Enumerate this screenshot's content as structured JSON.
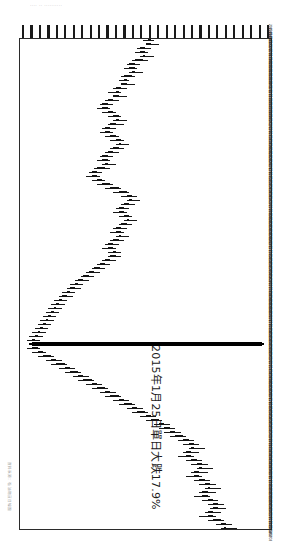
{
  "page": {
    "orientation": "rotated-90",
    "background_color": "#ffffff",
    "scan_header_text": "....  ..  ..........",
    "source_note": "資料來源：石油期貨日線圖"
  },
  "annotation": {
    "text": "2015年1月25日單日大跌17.9%",
    "color": "#1a1a1a"
  },
  "axes": {
    "price_axis_position": "top",
    "date_axis_position": "right",
    "tick_count": 30,
    "date_labels": [
      "2015/01/02",
      "2015/01/05",
      "2015/01/06",
      "2015/01/07",
      "2015/01/08",
      "2015/01/09",
      "2015/01/12",
      "2015/01/13",
      "2015/01/14",
      "2015/01/15",
      "2015/01/16",
      "2015/01/19",
      "2015/01/20",
      "2015/01/21",
      "2015/01/22",
      "2015/01/23",
      "2015/01/26",
      "2015/01/27",
      "2015/01/28",
      "2015/01/29",
      "2015/01/30",
      "2015/02/02",
      "2015/02/03",
      "2015/02/04",
      "2015/02/05",
      "2015/02/06",
      "2015/02/09",
      "2015/02/10",
      "2015/02/11",
      "2015/02/12",
      "2015/02/13",
      "2015/02/16",
      "2015/02/17",
      "2015/02/24",
      "2015/02/25",
      "2015/02/26",
      "2015/02/27",
      "2015/03/02",
      "2015/03/03",
      "2015/03/04",
      "2015/03/05",
      "2015/03/06",
      "2015/03/09",
      "2015/03/10",
      "2015/03/11",
      "2015/03/12",
      "2015/03/13",
      "2015/03/16",
      "2015/03/17",
      "2015/03/18",
      "2015/03/19",
      "2015/03/20",
      "2015/03/23",
      "2015/03/24",
      "2015/03/25",
      "2015/03/26",
      "2015/03/27",
      "2015/03/30",
      "2015/03/31",
      "2015/04/01",
      "2015/04/02",
      "2015/04/07",
      "2015/04/08",
      "2015/04/09",
      "2015/04/10",
      "2015/04/13",
      "2015/04/14",
      "2015/04/15",
      "2015/04/16",
      "2015/04/17",
      "2015/04/20",
      "2015/04/21",
      "2015/04/22",
      "2015/04/23",
      "2015/04/24",
      "2015/04/27",
      "2015/04/28",
      "2015/04/29",
      "2015/04/30",
      "2015/05/04",
      "2015/05/05",
      "2015/05/06",
      "2015/05/07",
      "2015/05/08",
      "2015/05/11",
      "2015/05/12",
      "2015/05/13",
      "2015/05/14",
      "2015/05/15",
      "2015/05/18",
      "2015/05/19",
      "2015/05/20",
      "2015/05/21",
      "2015/05/22",
      "2015/05/25",
      "2015/05/26",
      "2015/05/27",
      "2015/05/28",
      "2015/05/29",
      "2015/06/01",
      "2015/06/02",
      "2015/06/03",
      "2015/06/04",
      "2015/06/05",
      "2015/06/08",
      "2015/06/09",
      "2015/06/10",
      "2015/06/11",
      "2015/06/12",
      "2015/06/15",
      "2015/06/16",
      "2015/06/17",
      "2015/06/18",
      "2015/06/19",
      "2015/06/23",
      "2015/06/24",
      "2015/06/25",
      "2015/06/26",
      "2015/06/29",
      "2015/06/30",
      "2015/07/01",
      "2015/07/02",
      "2015/07/03"
    ]
  },
  "chart_data": {
    "type": "candlestick",
    "title": "",
    "xlabel": "",
    "ylabel": "",
    "orientation": "horizontal",
    "colors": {
      "up_body": "#ffffff",
      "down_body": "#111111",
      "outline": "#141414",
      "crash": "#000000"
    },
    "crash_event": {
      "index": 76,
      "label": "2015年1月25日單日大跌17.9%",
      "percent_change": -17.9
    },
    "candles": [
      {
        "i": 0,
        "o": 56,
        "h": 58,
        "l": 54,
        "c": 57,
        "dir": "up"
      },
      {
        "i": 1,
        "o": 57,
        "h": 60,
        "l": 56,
        "c": 55,
        "dir": "down"
      },
      {
        "i": 2,
        "o": 55,
        "h": 57,
        "l": 52,
        "c": 53,
        "dir": "down"
      },
      {
        "i": 3,
        "o": 53,
        "h": 56,
        "l": 51,
        "c": 55,
        "dir": "up"
      },
      {
        "i": 4,
        "o": 55,
        "h": 58,
        "l": 53,
        "c": 54,
        "dir": "down"
      },
      {
        "i": 5,
        "o": 54,
        "h": 56,
        "l": 50,
        "c": 51,
        "dir": "down"
      },
      {
        "i": 6,
        "o": 51,
        "h": 53,
        "l": 48,
        "c": 49,
        "dir": "down"
      },
      {
        "i": 7,
        "o": 49,
        "h": 52,
        "l": 47,
        "c": 51,
        "dir": "up"
      },
      {
        "i": 8,
        "o": 51,
        "h": 54,
        "l": 49,
        "c": 50,
        "dir": "down"
      },
      {
        "i": 9,
        "o": 50,
        "h": 51,
        "l": 46,
        "c": 47,
        "dir": "down"
      },
      {
        "i": 10,
        "o": 47,
        "h": 49,
        "l": 45,
        "c": 48,
        "dir": "up"
      },
      {
        "i": 11,
        "o": 48,
        "h": 51,
        "l": 46,
        "c": 46,
        "dir": "down"
      },
      {
        "i": 12,
        "o": 46,
        "h": 48,
        "l": 43,
        "c": 44,
        "dir": "down"
      },
      {
        "i": 13,
        "o": 44,
        "h": 46,
        "l": 41,
        "c": 45,
        "dir": "up"
      },
      {
        "i": 14,
        "o": 45,
        "h": 48,
        "l": 43,
        "c": 43,
        "dir": "down"
      },
      {
        "i": 15,
        "o": 43,
        "h": 45,
        "l": 40,
        "c": 41,
        "dir": "down"
      },
      {
        "i": 16,
        "o": 41,
        "h": 43,
        "l": 38,
        "c": 39,
        "dir": "down"
      },
      {
        "i": 17,
        "o": 39,
        "h": 42,
        "l": 37,
        "c": 41,
        "dir": "up"
      },
      {
        "i": 18,
        "o": 41,
        "h": 44,
        "l": 39,
        "c": 43,
        "dir": "up"
      },
      {
        "i": 19,
        "o": 43,
        "h": 46,
        "l": 41,
        "c": 45,
        "dir": "up"
      },
      {
        "i": 20,
        "o": 45,
        "h": 48,
        "l": 43,
        "c": 44,
        "dir": "down"
      },
      {
        "i": 21,
        "o": 44,
        "h": 47,
        "l": 41,
        "c": 42,
        "dir": "down"
      },
      {
        "i": 22,
        "o": 42,
        "h": 44,
        "l": 39,
        "c": 40,
        "dir": "down"
      },
      {
        "i": 23,
        "o": 40,
        "h": 43,
        "l": 38,
        "c": 42,
        "dir": "up"
      },
      {
        "i": 24,
        "o": 42,
        "h": 45,
        "l": 40,
        "c": 44,
        "dir": "up"
      },
      {
        "i": 25,
        "o": 44,
        "h": 47,
        "l": 42,
        "c": 46,
        "dir": "up"
      },
      {
        "i": 26,
        "o": 46,
        "h": 49,
        "l": 44,
        "c": 45,
        "dir": "down"
      },
      {
        "i": 27,
        "o": 45,
        "h": 47,
        "l": 42,
        "c": 43,
        "dir": "down"
      },
      {
        "i": 28,
        "o": 43,
        "h": 45,
        "l": 40,
        "c": 41,
        "dir": "down"
      },
      {
        "i": 29,
        "o": 41,
        "h": 43,
        "l": 38,
        "c": 39,
        "dir": "down"
      },
      {
        "i": 30,
        "o": 39,
        "h": 42,
        "l": 37,
        "c": 41,
        "dir": "up"
      },
      {
        "i": 31,
        "o": 41,
        "h": 44,
        "l": 39,
        "c": 40,
        "dir": "down"
      },
      {
        "i": 32,
        "o": 40,
        "h": 42,
        "l": 36,
        "c": 37,
        "dir": "down"
      },
      {
        "i": 33,
        "o": 37,
        "h": 39,
        "l": 34,
        "c": 35,
        "dir": "down"
      },
      {
        "i": 34,
        "o": 35,
        "h": 38,
        "l": 33,
        "c": 37,
        "dir": "up"
      },
      {
        "i": 35,
        "o": 37,
        "h": 40,
        "l": 35,
        "c": 39,
        "dir": "up"
      },
      {
        "i": 36,
        "o": 39,
        "h": 43,
        "l": 37,
        "c": 42,
        "dir": "up"
      },
      {
        "i": 37,
        "o": 42,
        "h": 46,
        "l": 40,
        "c": 45,
        "dir": "up"
      },
      {
        "i": 38,
        "o": 45,
        "h": 49,
        "l": 43,
        "c": 48,
        "dir": "up"
      },
      {
        "i": 39,
        "o": 48,
        "h": 52,
        "l": 46,
        "c": 50,
        "dir": "up"
      },
      {
        "i": 40,
        "o": 50,
        "h": 53,
        "l": 48,
        "c": 49,
        "dir": "down"
      },
      {
        "i": 41,
        "o": 49,
        "h": 51,
        "l": 46,
        "c": 47,
        "dir": "down"
      },
      {
        "i": 42,
        "o": 47,
        "h": 49,
        "l": 44,
        "c": 45,
        "dir": "down"
      },
      {
        "i": 43,
        "o": 45,
        "h": 48,
        "l": 43,
        "c": 47,
        "dir": "up"
      },
      {
        "i": 44,
        "o": 47,
        "h": 50,
        "l": 45,
        "c": 49,
        "dir": "up"
      },
      {
        "i": 45,
        "o": 49,
        "h": 52,
        "l": 47,
        "c": 48,
        "dir": "down"
      },
      {
        "i": 46,
        "o": 48,
        "h": 50,
        "l": 45,
        "c": 46,
        "dir": "down"
      },
      {
        "i": 47,
        "o": 46,
        "h": 48,
        "l": 43,
        "c": 44,
        "dir": "down"
      },
      {
        "i": 48,
        "o": 44,
        "h": 47,
        "l": 42,
        "c": 46,
        "dir": "up"
      },
      {
        "i": 49,
        "o": 46,
        "h": 49,
        "l": 44,
        "c": 45,
        "dir": "down"
      },
      {
        "i": 50,
        "o": 45,
        "h": 47,
        "l": 42,
        "c": 43,
        "dir": "down"
      },
      {
        "i": 51,
        "o": 43,
        "h": 45,
        "l": 40,
        "c": 41,
        "dir": "down"
      },
      {
        "i": 52,
        "o": 41,
        "h": 44,
        "l": 39,
        "c": 43,
        "dir": "up"
      },
      {
        "i": 53,
        "o": 43,
        "h": 46,
        "l": 41,
        "c": 44,
        "dir": "up"
      },
      {
        "i": 54,
        "o": 44,
        "h": 46,
        "l": 41,
        "c": 42,
        "dir": "down"
      },
      {
        "i": 55,
        "o": 42,
        "h": 44,
        "l": 39,
        "c": 40,
        "dir": "down"
      },
      {
        "i": 56,
        "o": 40,
        "h": 42,
        "l": 37,
        "c": 38,
        "dir": "down"
      },
      {
        "i": 57,
        "o": 38,
        "h": 40,
        "l": 35,
        "c": 36,
        "dir": "down"
      },
      {
        "i": 58,
        "o": 36,
        "h": 38,
        "l": 33,
        "c": 34,
        "dir": "down"
      },
      {
        "i": 59,
        "o": 34,
        "h": 36,
        "l": 31,
        "c": 32,
        "dir": "down"
      },
      {
        "i": 60,
        "o": 32,
        "h": 34,
        "l": 29,
        "c": 30,
        "dir": "down"
      },
      {
        "i": 61,
        "o": 30,
        "h": 32,
        "l": 27,
        "c": 29,
        "dir": "down"
      },
      {
        "i": 62,
        "o": 29,
        "h": 31,
        "l": 26,
        "c": 27,
        "dir": "down"
      },
      {
        "i": 63,
        "o": 27,
        "h": 29,
        "l": 24,
        "c": 26,
        "dir": "down"
      },
      {
        "i": 64,
        "o": 26,
        "h": 28,
        "l": 23,
        "c": 24,
        "dir": "down"
      },
      {
        "i": 65,
        "o": 24,
        "h": 26,
        "l": 21,
        "c": 23,
        "dir": "down"
      },
      {
        "i": 66,
        "o": 23,
        "h": 25,
        "l": 20,
        "c": 22,
        "dir": "down"
      },
      {
        "i": 67,
        "o": 22,
        "h": 24,
        "l": 19,
        "c": 21,
        "dir": "down"
      },
      {
        "i": 68,
        "o": 21,
        "h": 23,
        "l": 18,
        "c": 20,
        "dir": "down"
      },
      {
        "i": 69,
        "o": 20,
        "h": 22,
        "l": 17,
        "c": 19,
        "dir": "down"
      },
      {
        "i": 70,
        "o": 19,
        "h": 21,
        "l": 16,
        "c": 18,
        "dir": "down"
      },
      {
        "i": 71,
        "o": 18,
        "h": 20,
        "l": 15,
        "c": 17,
        "dir": "down"
      },
      {
        "i": 72,
        "o": 17,
        "h": 19,
        "l": 14,
        "c": 16,
        "dir": "down"
      },
      {
        "i": 73,
        "o": 16,
        "h": 18,
        "l": 13,
        "c": 15,
        "dir": "down"
      },
      {
        "i": 74,
        "o": 15,
        "h": 17,
        "l": 12,
        "c": 14,
        "dir": "down"
      },
      {
        "i": 75,
        "o": 14,
        "h": 16,
        "l": 11,
        "c": 13,
        "dir": "down"
      },
      {
        "i": 76,
        "o": 98,
        "h": 99,
        "l": 12,
        "c": 13,
        "dir": "crash"
      },
      {
        "i": 77,
        "o": 13,
        "h": 16,
        "l": 11,
        "c": 15,
        "dir": "up"
      },
      {
        "i": 78,
        "o": 15,
        "h": 18,
        "l": 13,
        "c": 17,
        "dir": "up"
      },
      {
        "i": 79,
        "o": 17,
        "h": 21,
        "l": 15,
        "c": 20,
        "dir": "up"
      },
      {
        "i": 80,
        "o": 20,
        "h": 24,
        "l": 18,
        "c": 22,
        "dir": "up"
      },
      {
        "i": 81,
        "o": 22,
        "h": 26,
        "l": 20,
        "c": 25,
        "dir": "up"
      },
      {
        "i": 82,
        "o": 25,
        "h": 29,
        "l": 23,
        "c": 27,
        "dir": "up"
      },
      {
        "i": 83,
        "o": 27,
        "h": 31,
        "l": 25,
        "c": 30,
        "dir": "up"
      },
      {
        "i": 84,
        "o": 30,
        "h": 34,
        "l": 28,
        "c": 32,
        "dir": "up"
      },
      {
        "i": 85,
        "o": 32,
        "h": 36,
        "l": 30,
        "c": 35,
        "dir": "up"
      },
      {
        "i": 86,
        "o": 35,
        "h": 39,
        "l": 33,
        "c": 37,
        "dir": "up"
      },
      {
        "i": 87,
        "o": 37,
        "h": 41,
        "l": 35,
        "c": 40,
        "dir": "up"
      },
      {
        "i": 88,
        "o": 40,
        "h": 44,
        "l": 38,
        "c": 42,
        "dir": "up"
      },
      {
        "i": 89,
        "o": 42,
        "h": 46,
        "l": 40,
        "c": 45,
        "dir": "up"
      },
      {
        "i": 90,
        "o": 45,
        "h": 49,
        "l": 43,
        "c": 47,
        "dir": "up"
      },
      {
        "i": 91,
        "o": 47,
        "h": 51,
        "l": 45,
        "c": 50,
        "dir": "up"
      },
      {
        "i": 92,
        "o": 50,
        "h": 54,
        "l": 48,
        "c": 52,
        "dir": "up"
      },
      {
        "i": 93,
        "o": 52,
        "h": 56,
        "l": 50,
        "c": 55,
        "dir": "up"
      },
      {
        "i": 94,
        "o": 55,
        "h": 59,
        "l": 53,
        "c": 57,
        "dir": "up"
      },
      {
        "i": 95,
        "o": 57,
        "h": 61,
        "l": 55,
        "c": 60,
        "dir": "up"
      },
      {
        "i": 96,
        "o": 60,
        "h": 64,
        "l": 58,
        "c": 62,
        "dir": "up"
      },
      {
        "i": 97,
        "o": 62,
        "h": 66,
        "l": 60,
        "c": 64,
        "dir": "up"
      },
      {
        "i": 98,
        "o": 64,
        "h": 68,
        "l": 62,
        "c": 66,
        "dir": "up"
      },
      {
        "i": 99,
        "o": 66,
        "h": 70,
        "l": 64,
        "c": 69,
        "dir": "up"
      },
      {
        "i": 100,
        "o": 69,
        "h": 73,
        "l": 67,
        "c": 71,
        "dir": "up"
      },
      {
        "i": 101,
        "o": 71,
        "h": 75,
        "l": 69,
        "c": 73,
        "dir": "up"
      },
      {
        "i": 102,
        "o": 73,
        "h": 77,
        "l": 71,
        "c": 72,
        "dir": "down"
      },
      {
        "i": 103,
        "o": 72,
        "h": 75,
        "l": 69,
        "c": 70,
        "dir": "down"
      },
      {
        "i": 104,
        "o": 70,
        "h": 73,
        "l": 67,
        "c": 72,
        "dir": "up"
      },
      {
        "i": 105,
        "o": 72,
        "h": 76,
        "l": 70,
        "c": 74,
        "dir": "up"
      },
      {
        "i": 106,
        "o": 74,
        "h": 78,
        "l": 72,
        "c": 76,
        "dir": "up"
      },
      {
        "i": 107,
        "o": 76,
        "h": 80,
        "l": 74,
        "c": 75,
        "dir": "down"
      },
      {
        "i": 108,
        "o": 75,
        "h": 78,
        "l": 72,
        "c": 73,
        "dir": "down"
      },
      {
        "i": 109,
        "o": 73,
        "h": 76,
        "l": 70,
        "c": 75,
        "dir": "up"
      },
      {
        "i": 110,
        "o": 75,
        "h": 79,
        "l": 73,
        "c": 77,
        "dir": "up"
      },
      {
        "i": 111,
        "o": 77,
        "h": 81,
        "l": 75,
        "c": 79,
        "dir": "up"
      },
      {
        "i": 112,
        "o": 79,
        "h": 83,
        "l": 77,
        "c": 78,
        "dir": "down"
      },
      {
        "i": 113,
        "o": 78,
        "h": 81,
        "l": 75,
        "c": 76,
        "dir": "down"
      },
      {
        "i": 114,
        "o": 76,
        "h": 79,
        "l": 73,
        "c": 78,
        "dir": "up"
      },
      {
        "i": 115,
        "o": 78,
        "h": 82,
        "l": 76,
        "c": 80,
        "dir": "up"
      },
      {
        "i": 116,
        "o": 80,
        "h": 84,
        "l": 78,
        "c": 82,
        "dir": "up"
      },
      {
        "i": 117,
        "o": 82,
        "h": 85,
        "l": 79,
        "c": 80,
        "dir": "down"
      },
      {
        "i": 118,
        "o": 80,
        "h": 83,
        "l": 77,
        "c": 78,
        "dir": "down"
      },
      {
        "i": 119,
        "o": 78,
        "h": 81,
        "l": 75,
        "c": 80,
        "dir": "up"
      },
      {
        "i": 120,
        "o": 80,
        "h": 84,
        "l": 78,
        "c": 83,
        "dir": "up"
      },
      {
        "i": 121,
        "o": 83,
        "h": 87,
        "l": 81,
        "c": 85,
        "dir": "up"
      },
      {
        "i": 122,
        "o": 85,
        "h": 89,
        "l": 83,
        "c": 84,
        "dir": "down"
      }
    ]
  }
}
